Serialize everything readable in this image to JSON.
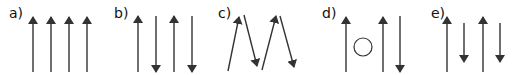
{
  "colors": {
    "arrow": "#333333",
    "circle": "#333333",
    "text": "#111111"
  },
  "panels": [
    {
      "label": "a)",
      "label_pos": [
        9,
        6
      ],
      "description": "four parallel arrows all pointing up",
      "arrows": [
        {
          "x1": 33,
          "y1": 72,
          "x2": 33,
          "y2": 17
        },
        {
          "x1": 51,
          "y1": 72,
          "x2": 51,
          "y2": 17
        },
        {
          "x1": 69,
          "y1": 72,
          "x2": 69,
          "y2": 17
        },
        {
          "x1": 87,
          "y1": 72,
          "x2": 87,
          "y2": 17
        }
      ]
    },
    {
      "label": "b)",
      "label_pos": [
        114,
        6
      ],
      "description": "four antiparallel arrows alternating up and down",
      "arrows": [
        {
          "x1": 138,
          "y1": 72,
          "x2": 138,
          "y2": 16
        },
        {
          "x1": 156,
          "y1": 16,
          "x2": 156,
          "y2": 72
        },
        {
          "x1": 174,
          "y1": 72,
          "x2": 174,
          "y2": 16
        },
        {
          "x1": 192,
          "y1": 16,
          "x2": 192,
          "y2": 72
        }
      ]
    },
    {
      "label": "c)",
      "label_pos": [
        218,
        6
      ],
      "description": "canted arrows in zigzag pattern",
      "arrows": [
        {
          "x1": 228,
          "y1": 71,
          "x2": 239,
          "y2": 17
        },
        {
          "x1": 244,
          "y1": 15,
          "x2": 257,
          "y2": 66
        },
        {
          "x1": 262,
          "y1": 70,
          "x2": 276,
          "y2": 16
        },
        {
          "x1": 280,
          "y1": 16,
          "x2": 294,
          "y2": 67
        }
      ]
    },
    {
      "label": "d)",
      "label_pos": [
        322,
        6
      ],
      "description": "two up arrows, one down arrow, with a vacancy circle",
      "arrows": [
        {
          "x1": 346,
          "y1": 72,
          "x2": 346,
          "y2": 17
        },
        {
          "x1": 383,
          "y1": 72,
          "x2": 383,
          "y2": 17
        },
        {
          "x1": 400,
          "y1": 16,
          "x2": 400,
          "y2": 72
        }
      ],
      "circle": {
        "cx": 363,
        "cy": 47,
        "r": 9
      }
    },
    {
      "label": "e)",
      "label_pos": [
        431,
        6
      ],
      "description": "long up arrows alternating with shorter down arrows",
      "arrows": [
        {
          "x1": 447,
          "y1": 72,
          "x2": 447,
          "y2": 17
        },
        {
          "x1": 464,
          "y1": 23,
          "x2": 464,
          "y2": 62
        },
        {
          "x1": 483,
          "y1": 72,
          "x2": 483,
          "y2": 17
        },
        {
          "x1": 500,
          "y1": 23,
          "x2": 500,
          "y2": 62
        }
      ]
    }
  ]
}
